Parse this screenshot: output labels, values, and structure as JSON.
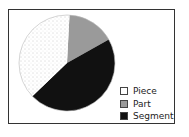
{
  "chart_data": {
    "type": "pie",
    "title": "",
    "categories": [
      "Piece",
      "Part",
      "Segment"
    ],
    "values": [
      38,
      16,
      46
    ],
    "colors": [
      "#ffffff",
      "#9a9a9a",
      "#111111"
    ],
    "patterns": [
      "dotted",
      "solid",
      "solid"
    ],
    "legend_position": "bottom-right"
  },
  "legend": {
    "items": [
      {
        "label": "Piece",
        "color": "#ffffff"
      },
      {
        "label": "Part",
        "color": "#9a9a9a"
      },
      {
        "label": "Segment",
        "color": "#111111"
      }
    ]
  }
}
